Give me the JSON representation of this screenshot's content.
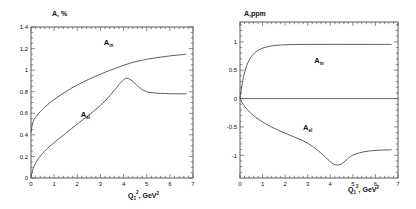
{
  "figure": {
    "background_color": "#ffffff",
    "curve_color": "#4a4a4a",
    "axis_color": "#5a5a5a"
  },
  "chart_data": [
    {
      "type": "line",
      "panel": "left",
      "title": "",
      "ylabel": "A, %",
      "xlabel_base": "Q",
      "xlabel_sub": "1",
      "xlabel_sup": "2",
      "xlabel_rest": ", GeV",
      "xlabel_rest_sup": "2",
      "xlabel_full": "Q₁², GeV²",
      "xlim": [
        0,
        7
      ],
      "ylim": [
        0,
        1.4
      ],
      "xticks": [
        0,
        1,
        2,
        3,
        4,
        5,
        6,
        7
      ],
      "xticklabels": [
        "0",
        "1",
        "2",
        "3",
        "4",
        "5",
        "6",
        "7"
      ],
      "yticks": [
        0,
        0.2,
        0.4,
        0.6,
        0.8,
        1,
        1.2,
        1.4
      ],
      "yticklabels": [
        "0",
        "0.2",
        "0.4",
        "0.6",
        "0.8",
        "1",
        "1.2",
        "1.4"
      ],
      "grid": false,
      "legend_position": "inline-annotations",
      "series": [
        {
          "name": "A_in",
          "label": "A",
          "label_sub": "in",
          "label_x": 3.35,
          "label_y": 1.235,
          "x": [
            0,
            0.05,
            0.1,
            0.15,
            0.2,
            0.3,
            0.4,
            0.5,
            0.65,
            0.8,
            1.0,
            1.25,
            1.5,
            1.75,
            2.0,
            2.25,
            2.5,
            2.75,
            3.0,
            3.25,
            3.5,
            3.75,
            4.0,
            4.25,
            4.5,
            4.75,
            5.0,
            5.5,
            6.0,
            6.5,
            6.7
          ],
          "y": [
            0.425,
            0.49,
            0.525,
            0.548,
            0.565,
            0.592,
            0.615,
            0.638,
            0.668,
            0.695,
            0.728,
            0.765,
            0.8,
            0.833,
            0.862,
            0.89,
            0.915,
            0.94,
            0.962,
            0.985,
            1.005,
            1.025,
            1.045,
            1.062,
            1.078,
            1.09,
            1.1,
            1.118,
            1.132,
            1.143,
            1.147
          ]
        },
        {
          "name": "A_el",
          "label": "A",
          "label_sub": "el",
          "label_x": 2.35,
          "label_y": 0.565,
          "x": [
            0,
            0.05,
            0.1,
            0.15,
            0.2,
            0.3,
            0.4,
            0.5,
            0.65,
            0.8,
            1.0,
            1.25,
            1.5,
            1.75,
            2.0,
            2.25,
            2.5,
            2.75,
            3.0,
            3.2,
            3.4,
            3.6,
            3.8,
            3.95,
            4.05,
            4.15,
            4.3,
            4.45,
            4.6,
            4.75,
            4.9,
            5.1,
            5.4,
            5.8,
            6.2,
            6.7
          ],
          "y": [
            0.012,
            0.055,
            0.09,
            0.118,
            0.14,
            0.175,
            0.203,
            0.228,
            0.262,
            0.292,
            0.328,
            0.372,
            0.415,
            0.458,
            0.5,
            0.542,
            0.585,
            0.628,
            0.672,
            0.715,
            0.762,
            0.812,
            0.865,
            0.9,
            0.918,
            0.925,
            0.912,
            0.885,
            0.855,
            0.828,
            0.808,
            0.795,
            0.787,
            0.783,
            0.781,
            0.78
          ]
        }
      ]
    },
    {
      "type": "line",
      "panel": "right",
      "title": "",
      "ylabel": "A,ppm",
      "xlabel_base": "Q",
      "xlabel_sub": "1",
      "xlabel_sup": "2",
      "xlabel_rest": ", GeV",
      "xlabel_rest_sup": "2",
      "xlabel_full": "Q₁², GeV²",
      "xlim": [
        0,
        7
      ],
      "ylim": [
        -1.4,
        1.35
      ],
      "xticks": [
        0,
        1,
        2,
        3,
        4,
        5,
        6,
        7
      ],
      "xticklabels": [
        "0",
        "1",
        "2",
        "3",
        "4",
        "5",
        "6",
        "7"
      ],
      "yticks": [
        -1,
        -0.5,
        0,
        0.5,
        1
      ],
      "yticklabels": [
        "-1",
        "-0.5",
        "0",
        "0.5",
        "1"
      ],
      "grid": false,
      "zero_line": true,
      "legend_position": "inline-annotations",
      "series": [
        {
          "name": "A_in",
          "label": "A",
          "label_sub": "in",
          "label_x": 3.5,
          "label_y": 0.63,
          "x": [
            0,
            0.05,
            0.1,
            0.15,
            0.2,
            0.3,
            0.4,
            0.5,
            0.65,
            0.8,
            1.0,
            1.2,
            1.4,
            1.6,
            1.8,
            2.0,
            2.3,
            2.6,
            3.0,
            3.5,
            4.0,
            4.5,
            5.0,
            5.5,
            6.0,
            6.5,
            6.7
          ],
          "y": [
            0.0,
            0.14,
            0.265,
            0.37,
            0.455,
            0.585,
            0.675,
            0.74,
            0.805,
            0.85,
            0.888,
            0.912,
            0.928,
            0.938,
            0.944,
            0.948,
            0.952,
            0.954,
            0.955,
            0.956,
            0.956,
            0.956,
            0.956,
            0.956,
            0.955,
            0.954,
            0.954
          ]
        },
        {
          "name": "A_el",
          "label": "A",
          "label_sub": "el",
          "label_x": 3.0,
          "label_y": -0.56,
          "x": [
            0,
            0.1,
            0.2,
            0.35,
            0.5,
            0.7,
            0.9,
            1.1,
            1.4,
            1.7,
            2.0,
            2.3,
            2.6,
            2.9,
            3.2,
            3.45,
            3.7,
            3.9,
            4.05,
            4.2,
            4.35,
            4.5,
            4.65,
            4.8,
            5.0,
            5.3,
            5.7,
            6.1,
            6.5,
            6.7
          ],
          "y": [
            0.0,
            -0.075,
            -0.135,
            -0.205,
            -0.265,
            -0.33,
            -0.385,
            -0.435,
            -0.5,
            -0.558,
            -0.61,
            -0.66,
            -0.71,
            -0.765,
            -0.838,
            -0.915,
            -1.0,
            -1.075,
            -1.13,
            -1.165,
            -1.17,
            -1.15,
            -1.105,
            -1.05,
            -0.998,
            -0.955,
            -0.925,
            -0.912,
            -0.905,
            -0.903
          ]
        }
      ]
    }
  ]
}
